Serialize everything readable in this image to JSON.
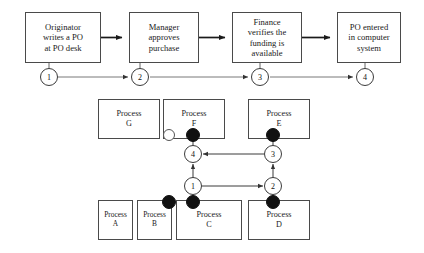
{
  "figure": {
    "flow": {
      "boxes": [
        {
          "id": "originator",
          "lines": [
            "Originator",
            "writes a PO",
            "at PO desk"
          ],
          "x": 25,
          "y": 12,
          "w": 76,
          "h": 51
        },
        {
          "id": "manager",
          "lines": [
            "Manager",
            "approves",
            "purchase"
          ],
          "x": 129,
          "y": 12,
          "w": 70,
          "h": 51
        },
        {
          "id": "finance",
          "lines": [
            "Finance",
            "verifies the",
            "funding is",
            "available"
          ],
          "x": 232,
          "y": 12,
          "w": 70,
          "h": 51
        },
        {
          "id": "po-entered",
          "lines": [
            "PO entered",
            "in computer",
            "system"
          ],
          "x": 337,
          "y": 12,
          "w": 64,
          "h": 51
        }
      ],
      "milestones": [
        {
          "label": "1",
          "cx": 49,
          "cy": 77
        },
        {
          "label": "2",
          "cx": 140,
          "cy": 77
        },
        {
          "label": "3",
          "cx": 260,
          "cy": 77
        },
        {
          "label": "4",
          "cx": 365,
          "cy": 77
        }
      ]
    },
    "petri": {
      "boxes": [
        {
          "id": "process-g",
          "lines": [
            "Process",
            "G"
          ],
          "x": 98,
          "y": 99,
          "w": 62,
          "h": 40
        },
        {
          "id": "process-f",
          "lines": [
            "Process",
            "F"
          ],
          "x": 163,
          "y": 99,
          "w": 62,
          "h": 40
        },
        {
          "id": "process-e",
          "lines": [
            "Process",
            "E"
          ],
          "x": 248,
          "y": 99,
          "w": 62,
          "h": 40
        },
        {
          "id": "process-a",
          "lines": [
            "Process",
            "A"
          ],
          "x": 98,
          "y": 200,
          "w": 35,
          "h": 40
        },
        {
          "id": "process-b",
          "lines": [
            "Process",
            "B"
          ],
          "x": 137,
          "y": 200,
          "w": 35,
          "h": 40
        },
        {
          "id": "process-c",
          "lines": [
            "Process",
            "C"
          ],
          "x": 176,
          "y": 200,
          "w": 66,
          "h": 40
        },
        {
          "id": "process-d",
          "lines": [
            "Process",
            "D"
          ],
          "x": 248,
          "y": 200,
          "w": 62,
          "h": 40
        }
      ],
      "transitions": [
        {
          "label": "4",
          "cx": 193,
          "cy": 154
        },
        {
          "label": "3",
          "cx": 273,
          "cy": 154
        },
        {
          "label": "1",
          "cx": 193,
          "cy": 186
        },
        {
          "label": "2",
          "cx": 273,
          "cy": 186
        }
      ],
      "tokens": [
        {
          "id": "token-f-hollow",
          "kind": "hollow",
          "cx": 169,
          "cy": 135
        },
        {
          "id": "token-f-filled",
          "kind": "filled",
          "cx": 193,
          "cy": 135
        },
        {
          "id": "token-e-filled",
          "cx": 273,
          "cy": 135,
          "kind": "filled"
        },
        {
          "id": "token-c-left",
          "kind": "filled",
          "cx": 169,
          "cy": 202
        },
        {
          "id": "token-c-right",
          "kind": "filled",
          "cx": 193,
          "cy": 202
        },
        {
          "id": "token-d",
          "kind": "filled",
          "cx": 273,
          "cy": 202
        }
      ]
    },
    "colors": {
      "background": "#ffffff",
      "box_border": "#4a4a4a",
      "line": "#555555",
      "token_filled": "#111111",
      "text": "#1a1a1a"
    }
  }
}
